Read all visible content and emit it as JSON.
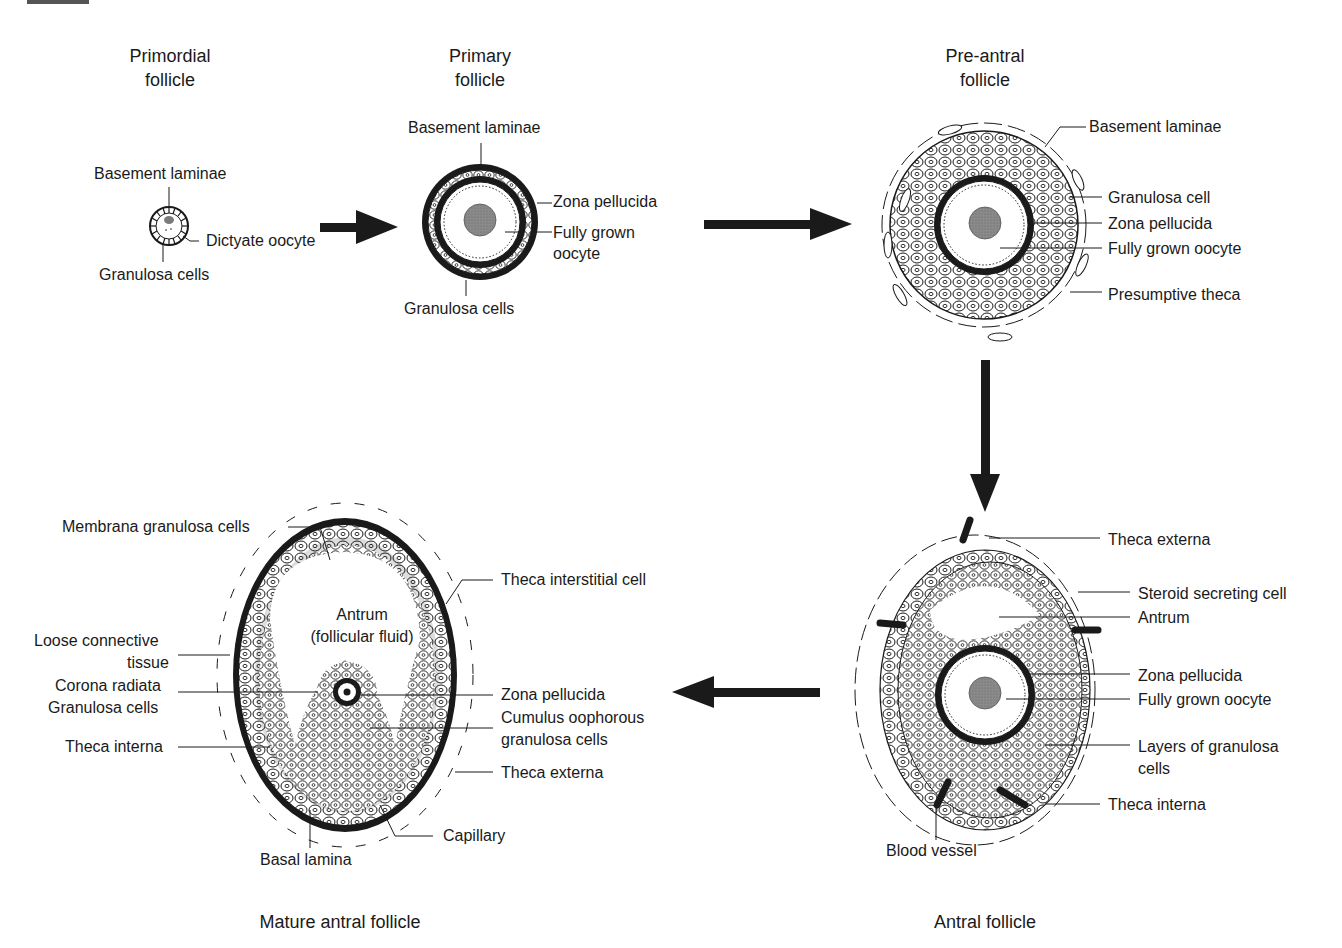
{
  "figure": {
    "stages": [
      {
        "id": "primordial",
        "title_line1": "Primordial",
        "title_line2": "follicle",
        "labels": {
          "basement_laminae": "Basement laminae",
          "dictyate_oocyte": "Dictyate oocyte",
          "granulosa_cells": "Granulosa cells"
        }
      },
      {
        "id": "primary",
        "title_line1": "Primary",
        "title_line2": "follicle",
        "labels": {
          "basement_laminae": "Basement laminae",
          "zona_pellucida": "Zona pellucida",
          "fully_grown_oocyte_1": "Fully grown",
          "fully_grown_oocyte_2": "oocyte",
          "granulosa_cells": "Granulosa cells"
        }
      },
      {
        "id": "pre_antral",
        "title_line1": "Pre-antral",
        "title_line2": "follicle",
        "labels": {
          "basement_laminae": "Basement laminae",
          "granulosa_cell": "Granulosa cell",
          "zona_pellucida": "Zona pellucida",
          "fully_grown_oocyte": "Fully grown oocyte",
          "presumptive_theca": "Presumptive theca"
        }
      },
      {
        "id": "antral",
        "title": "Antral follicle",
        "labels": {
          "theca_externa": "Theca externa",
          "steroid_secreting_cell": "Steroid secreting cell",
          "antrum": "Antrum",
          "zona_pellucida": "Zona pellucida",
          "fully_grown_oocyte": "Fully grown oocyte",
          "layers_granulosa_1": "Layers of granulosa",
          "layers_granulosa_2": "cells",
          "theca_interna": "Theca interna",
          "blood_vessel": "Blood vessel"
        }
      },
      {
        "id": "mature_antral",
        "title": "Mature antral follicle",
        "labels": {
          "membrana_granulosa": "Membrana granulosa cells",
          "theca_interstitial": "Theca interstitial cell",
          "antrum_1": "Antrum",
          "antrum_2": "(follicular fluid)",
          "loose_connective_1": "Loose connective",
          "loose_connective_2": "tissue",
          "corona_radiata_1": "Corona radiata",
          "corona_radiata_2": "Granulosa cells",
          "zona_pellucida": "Zona pellucida",
          "cumulus_1": "Cumulus oophorous",
          "cumulus_2": "granulosa cells",
          "theca_interna": "Theca interna",
          "theca_externa": "Theca externa",
          "capillary": "Capillary",
          "basal_lamina": "Basal lamina"
        }
      }
    ],
    "arrows": [
      {
        "from": "primordial",
        "to": "primary",
        "direction": "right"
      },
      {
        "from": "primary",
        "to": "pre_antral",
        "direction": "right"
      },
      {
        "from": "pre_antral",
        "to": "antral",
        "direction": "down"
      },
      {
        "from": "antral",
        "to": "mature_antral",
        "direction": "left"
      }
    ],
    "colors": {
      "ink": "#1a1a1a",
      "nucleus": "#8a8a8a",
      "background": "#ffffff"
    }
  }
}
